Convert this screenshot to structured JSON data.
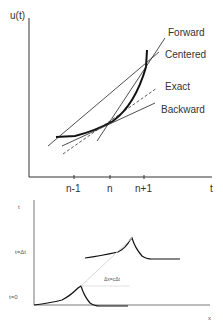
{
  "top_plot": {
    "y_axis_label": "u(t)",
    "x_axis_label": "t",
    "ticks": [
      "n-1",
      "n",
      "n+1"
    ],
    "legend": {
      "forward": "Forward",
      "centered": "Centered",
      "exact": "Exact",
      "backward": "Backward"
    }
  },
  "bottom_plot": {
    "y_axis_label": "t",
    "x_axis_label": "x",
    "levels": {
      "t_delta": "t=Δt",
      "t_zero": "t=0"
    },
    "annotation": "Δx=cΔt"
  }
}
